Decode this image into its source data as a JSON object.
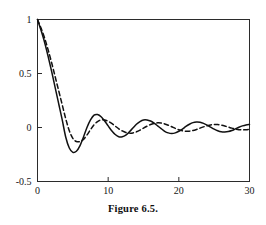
{
  "caption": "Figure 6.5.",
  "chart_data": {
    "type": "line",
    "title": "",
    "xlabel": "",
    "ylabel": "",
    "xlim": [
      0,
      30
    ],
    "ylim": [
      -0.5,
      1.0
    ],
    "grid": false,
    "legend": "none",
    "frame": "box",
    "tick_direction": "in",
    "xticks": [
      0,
      10,
      20,
      30
    ],
    "xtick_labels": [
      "0",
      "10",
      "20",
      "30"
    ],
    "yticks": [
      -0.5,
      0,
      0.5,
      1
    ],
    "ytick_labels": [
      "-0.5",
      "0",
      "0.5",
      "1"
    ],
    "series": [
      {
        "name": "solid-curve",
        "style": "solid",
        "color": "#111111",
        "description": "damped oscillation, larger amplitude, shorter period",
        "x": [
          0,
          0.5,
          1,
          1.5,
          2,
          2.5,
          3,
          3.5,
          4,
          4.5,
          5,
          5.5,
          6,
          6.5,
          7,
          7.5,
          8,
          8.5,
          9,
          9.5,
          10,
          10.5,
          11,
          11.5,
          12,
          12.5,
          13,
          13.5,
          14,
          14.5,
          15,
          15.5,
          16,
          16.5,
          17,
          17.5,
          18,
          18.5,
          19,
          19.5,
          20,
          20.5,
          21,
          21.5,
          22,
          22.5,
          23,
          23.5,
          24,
          24.5,
          25,
          25.5,
          26,
          26.5,
          27,
          27.5,
          28,
          28.5,
          29,
          29.5,
          30
        ],
        "y": [
          1.0,
          0.9,
          0.79,
          0.66,
          0.52,
          0.37,
          0.22,
          0.07,
          -0.09,
          -0.19,
          -0.23,
          -0.22,
          -0.17,
          -0.09,
          0.0,
          0.07,
          0.115,
          0.12,
          0.1,
          0.06,
          0.015,
          -0.03,
          -0.065,
          -0.085,
          -0.085,
          -0.07,
          -0.04,
          -0.005,
          0.03,
          0.055,
          0.07,
          0.07,
          0.06,
          0.04,
          0.015,
          -0.01,
          -0.035,
          -0.05,
          -0.055,
          -0.05,
          -0.035,
          -0.015,
          0.01,
          0.03,
          0.045,
          0.05,
          0.048,
          0.038,
          0.022,
          0.003,
          -0.015,
          -0.03,
          -0.04,
          -0.042,
          -0.038,
          -0.028,
          -0.013,
          0.002,
          0.015,
          0.024,
          0.028
        ]
      },
      {
        "name": "dashed-curve",
        "style": "dashed",
        "color": "#111111",
        "description": "damped oscillation, smaller amplitude, slightly longer period",
        "x": [
          0,
          0.5,
          1,
          1.5,
          2,
          2.5,
          3,
          3.5,
          4,
          4.5,
          5,
          5.5,
          6,
          6.5,
          7,
          7.5,
          8,
          8.5,
          9,
          9.5,
          10,
          10.5,
          11,
          11.5,
          12,
          12.5,
          13,
          13.5,
          14,
          14.5,
          15,
          15.5,
          16,
          16.5,
          17,
          17.5,
          18,
          18.5,
          19,
          19.5,
          20,
          20.5,
          21,
          21.5,
          22,
          22.5,
          23,
          23.5,
          24,
          24.5,
          25,
          25.5,
          26,
          26.5,
          27,
          27.5,
          28,
          28.5,
          29,
          29.5,
          30
        ],
        "y": [
          1.0,
          0.92,
          0.83,
          0.72,
          0.6,
          0.47,
          0.34,
          0.21,
          0.08,
          -0.03,
          -0.1,
          -0.13,
          -0.13,
          -0.11,
          -0.07,
          -0.02,
          0.025,
          0.055,
          0.07,
          0.07,
          0.058,
          0.038,
          0.013,
          -0.012,
          -0.032,
          -0.046,
          -0.052,
          -0.05,
          -0.04,
          -0.025,
          -0.006,
          0.012,
          0.028,
          0.038,
          0.043,
          0.041,
          0.033,
          0.021,
          0.007,
          -0.008,
          -0.021,
          -0.03,
          -0.035,
          -0.034,
          -0.028,
          -0.018,
          -0.006,
          0.006,
          0.016,
          0.024,
          0.028,
          0.027,
          0.022,
          0.014,
          0.004,
          -0.006,
          -0.014,
          -0.02,
          -0.022,
          -0.02,
          -0.016
        ]
      }
    ]
  }
}
